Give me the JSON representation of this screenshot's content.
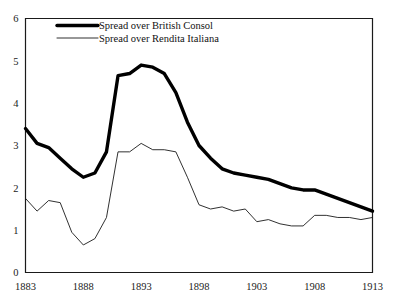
{
  "chart_data": {
    "type": "line",
    "title": "",
    "subtitle": "",
    "xlabel": "",
    "ylabel": "",
    "xlim": [
      1883,
      1913
    ],
    "ylim": [
      0,
      6
    ],
    "xticks": [
      1883,
      1888,
      1893,
      1898,
      1903,
      1908,
      1913
    ],
    "yticks": [
      0,
      1,
      2,
      3,
      4,
      5,
      6
    ],
    "xtick_labels": [
      "1883",
      "1888",
      "1893",
      "1898",
      "1903",
      "1908",
      "1913"
    ],
    "ytick_labels": [
      "0",
      "1",
      "2",
      "3",
      "4",
      "5",
      "6"
    ],
    "grid": false,
    "legend_position": "top-left-inside",
    "x": [
      1883,
      1884,
      1885,
      1886,
      1887,
      1888,
      1889,
      1890,
      1891,
      1892,
      1893,
      1894,
      1895,
      1896,
      1897,
      1898,
      1899,
      1900,
      1901,
      1902,
      1903,
      1904,
      1905,
      1906,
      1907,
      1908,
      1909,
      1910,
      1911,
      1912,
      1913
    ],
    "series": [
      {
        "name": "Spread over British Consol",
        "style": "thick",
        "color": "#000000",
        "values": [
          3.4,
          3.05,
          2.95,
          2.7,
          2.45,
          2.25,
          2.35,
          2.85,
          4.65,
          4.7,
          4.9,
          4.85,
          4.7,
          4.25,
          3.55,
          3.0,
          2.7,
          2.45,
          2.35,
          2.3,
          2.25,
          2.2,
          2.1,
          2.0,
          1.95,
          1.95,
          1.85,
          1.75,
          1.65,
          1.55,
          1.45
        ]
      },
      {
        "name": "Spread over Rendita Italiana",
        "style": "thin",
        "color": "#1a1a1a",
        "values": [
          1.75,
          1.45,
          1.7,
          1.65,
          0.95,
          0.65,
          0.8,
          1.3,
          2.85,
          2.85,
          3.05,
          2.9,
          2.9,
          2.85,
          2.25,
          1.6,
          1.5,
          1.55,
          1.45,
          1.5,
          1.2,
          1.25,
          1.15,
          1.1,
          1.1,
          1.35,
          1.35,
          1.3,
          1.3,
          1.25,
          1.3
        ]
      }
    ],
    "legend": [
      {
        "label": "Spread over British Consol",
        "style": "thick"
      },
      {
        "label": "Spread over Rendita Italiana",
        "style": "thin"
      }
    ]
  }
}
